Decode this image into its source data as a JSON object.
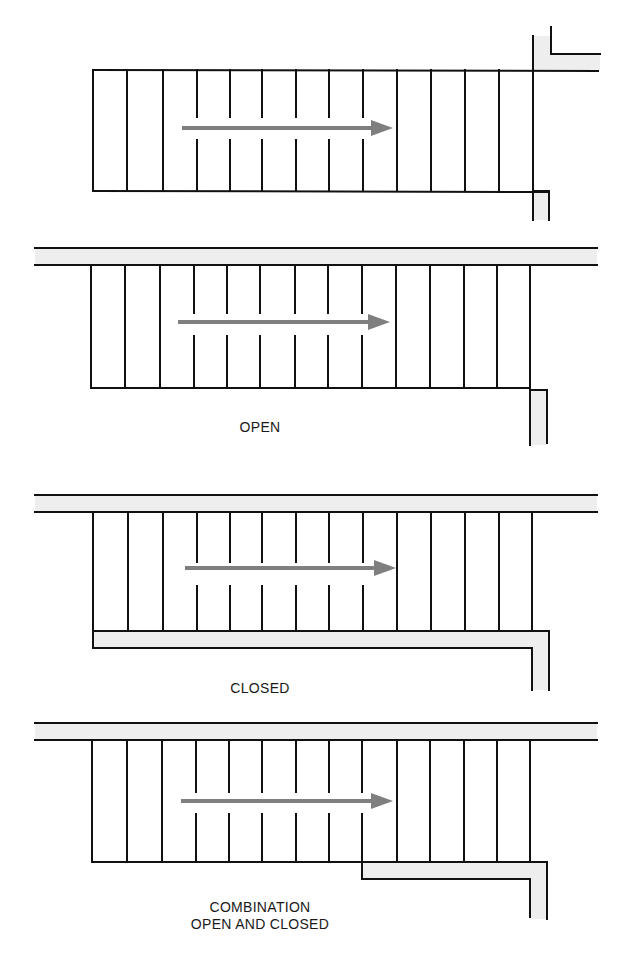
{
  "colors": {
    "line": "#111111",
    "wall_fill": "#eeeeee",
    "arrow": "#7f7f7f",
    "caption": "#1a1a1a"
  },
  "diagrams": [
    {
      "id": "stair-1",
      "caption": [],
      "stair": {
        "x": 93,
        "top": 70,
        "bottom": 191,
        "right": 533
      },
      "risers": [
        127,
        163,
        197,
        230,
        262,
        296,
        329,
        363,
        397,
        431,
        465,
        499
      ],
      "split_risers": [
        197,
        230,
        262,
        296,
        329,
        363
      ],
      "gap": [
        117,
        140
      ],
      "arrow": {
        "x1": 182,
        "x2": 393,
        "y": 128
      },
      "walls": "end-wall"
    },
    {
      "id": "stair-2-open",
      "caption": [
        "OPEN"
      ],
      "caption_pos": {
        "x": 260,
        "y": 419
      },
      "stair": {
        "x": 91,
        "top": 265,
        "bottom": 388,
        "right": 530
      },
      "risers": [
        125,
        160,
        194,
        227,
        260,
        295,
        328,
        362,
        396,
        430,
        464,
        497
      ],
      "split_risers": [
        194,
        227,
        260,
        295,
        328,
        362
      ],
      "gap": [
        313,
        336
      ],
      "arrow": {
        "x1": 178,
        "x2": 390,
        "y": 322
      },
      "walls": "open"
    },
    {
      "id": "stair-3-closed",
      "caption": [
        "CLOSED"
      ],
      "caption_pos": {
        "x": 260,
        "y": 680
      },
      "stair": {
        "x": 93,
        "top": 512,
        "bottom": 631,
        "right": 532
      },
      "risers": [
        128,
        163,
        197,
        230,
        262,
        296,
        329,
        363,
        397,
        431,
        465,
        499
      ],
      "split_risers": [
        197,
        230,
        262,
        296,
        329,
        363
      ],
      "gap": [
        562,
        586
      ],
      "arrow": {
        "x1": 185,
        "x2": 396,
        "y": 568
      },
      "walls": "closed"
    },
    {
      "id": "stair-4-combination",
      "caption": [
        "COMBINATION",
        "OPEN AND CLOSED"
      ],
      "caption_pos": {
        "x": 260,
        "y": 899
      },
      "stair": {
        "x": 92,
        "top": 740,
        "bottom": 862,
        "right": 530
      },
      "risers": [
        127,
        162,
        196,
        229,
        262,
        296,
        329,
        362,
        397,
        430,
        464,
        497
      ],
      "split_risers": [
        196,
        229,
        262,
        296,
        329,
        362
      ],
      "gap": [
        792,
        814
      ],
      "arrow": {
        "x1": 181,
        "x2": 393,
        "y": 801
      },
      "walls": "combination"
    }
  ]
}
